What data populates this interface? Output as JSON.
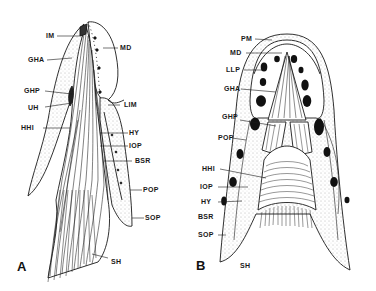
{
  "figure": {
    "panels": [
      {
        "id": "A",
        "letter": "A",
        "labels": [
          "IM",
          "MD",
          "GHA",
          "GHP",
          "UH",
          "LIM",
          "HHI",
          "HY",
          "IOP",
          "BSR",
          "POP",
          "SOP",
          "SH"
        ]
      },
      {
        "id": "B",
        "letter": "B",
        "labels": [
          "PM",
          "MD",
          "LLP",
          "GHA",
          "GHP",
          "POP",
          "HHI",
          "IOP",
          "HY",
          "BSR",
          "SOP",
          "SH"
        ]
      }
    ],
    "colors": {
      "ink": "#1a1a1a",
      "stipple": "#8a8a8a",
      "background": "#ffffff"
    }
  }
}
